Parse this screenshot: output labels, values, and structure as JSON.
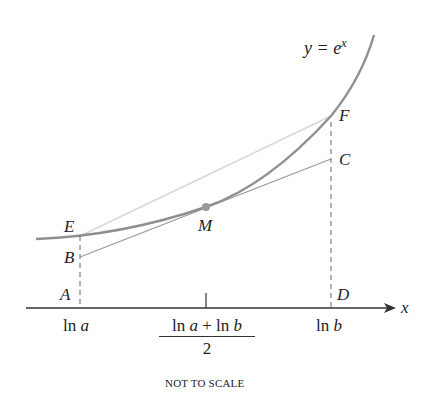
{
  "diagram": {
    "curve_label": "y = e^x",
    "curve_label_parts": {
      "base": "y = e",
      "exp": "x"
    },
    "axis_label": "x",
    "points": {
      "A": "A",
      "B": "B",
      "C": "C",
      "D": "D",
      "E": "E",
      "F": "F",
      "M": "M"
    },
    "ticks": {
      "left": {
        "fn": "ln",
        "var": "a"
      },
      "mid_numerator": {
        "fn1": "ln",
        "var1": "a",
        "op": "+",
        "fn2": "ln",
        "var2": "b"
      },
      "mid_denominator": "2",
      "right": {
        "fn": "ln",
        "var": "b"
      }
    },
    "note": "NOT TO SCALE",
    "colors": {
      "curve": "#8f8f8f",
      "secant": "#d8d8d8",
      "tangent": "#9a9a9a",
      "axis": "#333333",
      "dashed": "#666666",
      "point_M": "#9a9a9a",
      "text": "#222222"
    }
  }
}
